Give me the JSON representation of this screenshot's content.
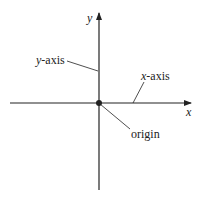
{
  "diagram": {
    "type": "coordinate-axes",
    "colors": {
      "stroke": "#222222",
      "background": "#ffffff"
    },
    "axes": {
      "x_label": "x",
      "y_label": "y"
    },
    "annotations": {
      "y_axis": {
        "var": "y",
        "suffix": "-axis"
      },
      "x_axis": {
        "var": "x",
        "suffix": "-axis"
      },
      "origin": "origin"
    }
  }
}
